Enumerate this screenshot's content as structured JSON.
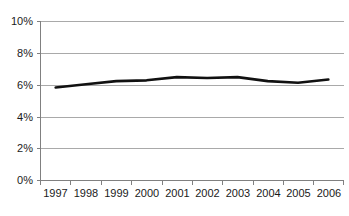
{
  "chart_data": {
    "type": "line",
    "title": "",
    "subtitle": "",
    "xlabel": "",
    "ylabel": "",
    "categories": [
      "1997",
      "1998",
      "1999",
      "2000",
      "2001",
      "2002",
      "2003",
      "2004",
      "2005",
      "2006"
    ],
    "values": [
      5.85,
      6.05,
      6.25,
      6.3,
      6.5,
      6.45,
      6.5,
      6.25,
      6.15,
      6.35
    ],
    "series": [
      {
        "name": "",
        "values": [
          5.85,
          6.05,
          6.25,
          6.3,
          6.5,
          6.45,
          6.5,
          6.25,
          6.15,
          6.35
        ]
      }
    ],
    "ytick_labels": [
      "0%",
      "2%",
      "4%",
      "6%",
      "8%",
      "10%"
    ],
    "ytick_values": [
      0,
      2,
      4,
      6,
      8,
      10
    ],
    "ylim": [
      0,
      10
    ],
    "grid": "horizontal",
    "legend": "none",
    "line_color": "#111111",
    "gridline_color": "#a9a9a9",
    "axis_color": "#808080",
    "background_color": "#ffffff"
  },
  "axes": {
    "y_tick_0": "0%",
    "y_tick_1": "2%",
    "y_tick_2": "4%",
    "y_tick_3": "6%",
    "y_tick_4": "8%",
    "y_tick_5": "10%",
    "x_tick_0": "1997",
    "x_tick_1": "1998",
    "x_tick_2": "1999",
    "x_tick_3": "2000",
    "x_tick_4": "2001",
    "x_tick_5": "2002",
    "x_tick_6": "2003",
    "x_tick_7": "2004",
    "x_tick_8": "2005",
    "x_tick_9": "2006"
  }
}
